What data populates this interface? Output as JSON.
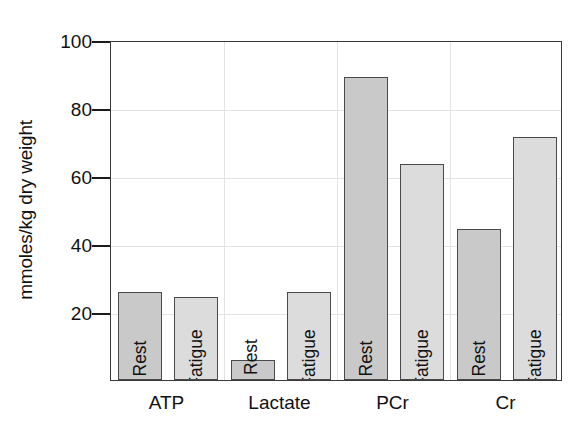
{
  "chart_data": {
    "type": "bar",
    "title": "",
    "xlabel": "",
    "ylabel": "mmoles/kg dry weight",
    "ylim": [
      0,
      100
    ],
    "yticks": [
      20,
      40,
      60,
      80,
      100
    ],
    "grid": true,
    "legend_position": "none",
    "categories": [
      "ATP",
      "Lactate",
      "PCr",
      "Cr"
    ],
    "series": [
      {
        "name": "Rest",
        "values": [
          26.0,
          6.0,
          89.0,
          44.5
        ]
      },
      {
        "name": "Fatigue",
        "values": [
          24.5,
          26.0,
          63.5,
          71.5
        ]
      }
    ],
    "bar_labels": [
      [
        "Rest",
        "Fatigue"
      ],
      [
        "Rest",
        "Fatigue"
      ],
      [
        "Rest",
        "Fatigue"
      ],
      [
        "Rest",
        "Fatigue"
      ]
    ],
    "colors": {
      "rest_fill": "#c9c9c9",
      "fatigue_fill": "#dcdcdc",
      "bar_border": "#4a4a4a",
      "axis": "#3a3a3a",
      "gridline": "#e3e3e3",
      "text": "#111111",
      "background": "#ffffff"
    }
  },
  "axis": {
    "y_title": "mmoles/kg dry weight",
    "tick_labels": [
      "20",
      "40",
      "60",
      "80",
      "100"
    ]
  }
}
